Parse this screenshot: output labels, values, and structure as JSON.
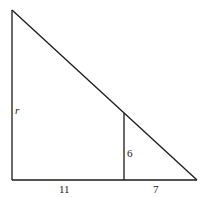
{
  "diagram": {
    "type": "right-triangle-similar",
    "vertices": {
      "top_left": [
        12,
        10
      ],
      "bottom_left": [
        12,
        180
      ],
      "bottom_right": [
        197,
        180
      ],
      "inner_top": [
        124,
        113
      ],
      "inner_bottom": [
        124,
        180
      ]
    },
    "labels": {
      "left_side": "r",
      "inner_height": "6",
      "base_left": "11",
      "base_right": "7"
    },
    "colors": {
      "stroke": "#1a1a1a",
      "background": "#ffffff"
    }
  }
}
